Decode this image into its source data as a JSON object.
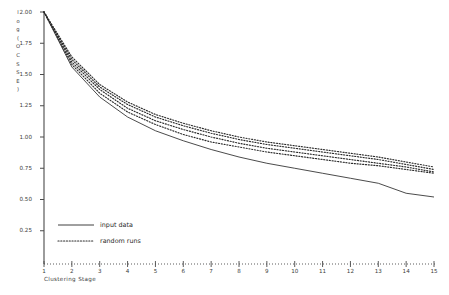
{
  "chart_data": {
    "type": "line",
    "title": "",
    "xlabel": "Clustering Stage",
    "ylabel": "log(OCSSE)",
    "ylabel_chars": "l\no\ng\n(\nO\nC\nS\nS\nE\n)",
    "xlim": [
      1,
      15
    ],
    "ylim": [
      0.0,
      2.0
    ],
    "grid": false,
    "x": [
      1,
      2,
      3,
      4,
      5,
      6,
      7,
      8,
      9,
      10,
      11,
      12,
      13,
      14,
      15
    ],
    "xticklabels": [
      "1",
      "2",
      "3",
      "4",
      "5",
      "6",
      "7",
      "8",
      "9",
      "10",
      "11",
      "12",
      "13",
      "14",
      "15"
    ],
    "yticks": [
      0.25,
      0.5,
      0.75,
      1.0,
      1.25,
      1.5,
      1.75,
      2.0
    ],
    "yticklabels": [
      "0.25",
      "0.50",
      "0.75",
      "1.00",
      "1.25",
      "1.50",
      "1.75",
      "2.00"
    ],
    "legend_position": "lower-left-inside",
    "series": [
      {
        "name": "input data",
        "style": "solid",
        "values": [
          2.0,
          1.56,
          1.32,
          1.16,
          1.05,
          0.97,
          0.9,
          0.84,
          0.79,
          0.75,
          0.71,
          0.67,
          0.63,
          0.55,
          0.52
        ]
      },
      {
        "name": "random runs",
        "style": "dotted",
        "runs": [
          [
            2.0,
            1.62,
            1.4,
            1.26,
            1.16,
            1.09,
            1.03,
            0.98,
            0.94,
            0.91,
            0.88,
            0.85,
            0.82,
            0.78,
            0.74
          ],
          [
            2.0,
            1.6,
            1.38,
            1.23,
            1.13,
            1.06,
            1.0,
            0.95,
            0.91,
            0.88,
            0.85,
            0.82,
            0.79,
            0.76,
            0.72
          ],
          [
            2.0,
            1.58,
            1.35,
            1.2,
            1.1,
            1.02,
            0.96,
            0.92,
            0.88,
            0.85,
            0.82,
            0.79,
            0.77,
            0.74,
            0.71
          ],
          [
            2.0,
            1.64,
            1.42,
            1.28,
            1.18,
            1.11,
            1.05,
            1.0,
            0.96,
            0.93,
            0.9,
            0.87,
            0.84,
            0.8,
            0.76
          ]
        ]
      }
    ]
  },
  "legend": {
    "items": [
      {
        "label": "input data",
        "style": "solid"
      },
      {
        "label": "random runs",
        "style": "dotted"
      }
    ]
  }
}
